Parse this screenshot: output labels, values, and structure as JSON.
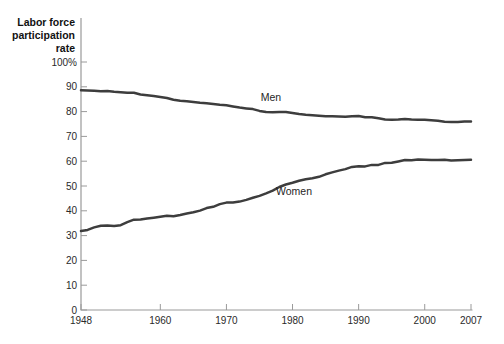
{
  "figure": {
    "y_axis_title_lines": [
      "Labor force",
      "participation",
      "rate"
    ],
    "colors": {
      "background": "#ffffff",
      "line": "#3d3d3d",
      "axis": "#9a9a9a",
      "text": "#1f1f1f"
    }
  },
  "chart_data": {
    "type": "line",
    "title": "",
    "xlabel": "",
    "ylabel": "Labor force participation rate",
    "grid": false,
    "legend_position": "inline-annotations",
    "xlim": [
      1948,
      2007
    ],
    "ylim": [
      0,
      100
    ],
    "xticks": [
      1948,
      1960,
      1970,
      1980,
      1990,
      2000,
      2007
    ],
    "x_tick_labels": [
      "1948",
      "1960",
      "1970",
      "1980",
      "1990",
      "2000",
      "2007"
    ],
    "yticks": [
      0,
      10,
      20,
      30,
      40,
      50,
      60,
      70,
      80,
      90,
      100
    ],
    "y_tick_labels": [
      "0",
      "10",
      "20",
      "30",
      "40",
      "50",
      "60",
      "70",
      "80",
      "90",
      "100%"
    ],
    "x": [
      1948,
      1949,
      1950,
      1951,
      1952,
      1953,
      1954,
      1955,
      1956,
      1957,
      1958,
      1959,
      1960,
      1961,
      1962,
      1963,
      1964,
      1965,
      1966,
      1967,
      1968,
      1969,
      1970,
      1971,
      1972,
      1973,
      1974,
      1975,
      1976,
      1977,
      1978,
      1979,
      1980,
      1981,
      1982,
      1983,
      1984,
      1985,
      1986,
      1987,
      1988,
      1989,
      1990,
      1991,
      1992,
      1993,
      1994,
      1995,
      1996,
      1997,
      1998,
      1999,
      2000,
      2001,
      2002,
      2003,
      2004,
      2005,
      2006,
      2007
    ],
    "series": [
      {
        "name": "Men",
        "values": [
          88.6,
          88.5,
          88.4,
          88.2,
          88.3,
          88.0,
          87.8,
          87.6,
          87.6,
          86.9,
          86.6,
          86.3,
          85.9,
          85.5,
          84.8,
          84.4,
          84.2,
          83.9,
          83.6,
          83.4,
          83.1,
          82.8,
          82.6,
          82.1,
          81.6,
          81.3,
          81.0,
          80.3,
          79.8,
          79.7,
          79.8,
          79.8,
          79.4,
          79.0,
          78.7,
          78.5,
          78.3,
          78.1,
          78.1,
          78.0,
          77.9,
          78.1,
          78.2,
          77.7,
          77.7,
          77.3,
          76.8,
          76.7,
          76.8,
          77.0,
          76.8,
          76.7,
          76.7,
          76.5,
          76.3,
          75.9,
          75.8,
          75.8,
          76.0,
          76.0
        ]
      },
      {
        "name": "Women",
        "values": [
          31.8,
          32.3,
          33.3,
          34.0,
          34.1,
          33.9,
          34.2,
          35.4,
          36.4,
          36.5,
          36.9,
          37.2,
          37.6,
          38.0,
          37.8,
          38.3,
          38.9,
          39.4,
          40.1,
          41.1,
          41.6,
          42.7,
          43.3,
          43.3,
          43.7,
          44.4,
          45.3,
          46.0,
          47.0,
          48.1,
          49.6,
          50.6,
          51.3,
          52.1,
          52.7,
          53.1,
          53.7,
          54.7,
          55.5,
          56.2,
          56.8,
          57.7,
          58.0,
          57.9,
          58.5,
          58.5,
          59.3,
          59.4,
          59.9,
          60.5,
          60.4,
          60.7,
          60.6,
          60.5,
          60.5,
          60.6,
          60.3,
          60.4,
          60.5,
          60.6
        ]
      }
    ],
    "annotations": [
      {
        "text": "Men",
        "x": 1975.2,
        "y": 84.3,
        "placement": "above-line"
      },
      {
        "text": "Women",
        "x": 1977.5,
        "y": 46.2,
        "placement": "below-line"
      }
    ]
  }
}
